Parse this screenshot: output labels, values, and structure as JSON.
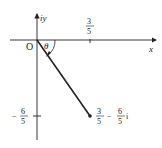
{
  "diagram": {
    "axes": {
      "x_label": "x",
      "y_label": "iy",
      "origin_label": "O"
    },
    "angle_label": "θ",
    "ticks": {
      "x_tick": {
        "num": "3",
        "den": "5"
      },
      "y_tick": {
        "sign": "−",
        "num": "6",
        "den": "5"
      }
    },
    "point": {
      "re_num": "3",
      "re_den": "5",
      "op": "−",
      "im_num": "6",
      "im_den": "5",
      "im_unit": "i"
    },
    "colors": {
      "ink": "#222222",
      "background": "#ffffff"
    }
  }
}
